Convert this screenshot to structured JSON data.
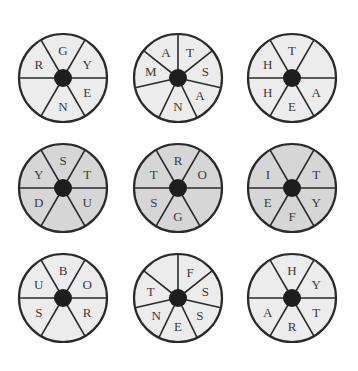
{
  "puzzle": {
    "colors": {
      "light_fill": "#ececec",
      "dark_fill": "#d6d6d6",
      "stroke": "#2a2a2a",
      "hub": "#1e1e1e",
      "text": "#3a3a3a"
    },
    "wheels": [
      {
        "id": 1,
        "cx": 63,
        "cy": 78,
        "fill": "light",
        "segments": 6,
        "letters": [
          "G",
          "Y",
          "E",
          "N",
          "",
          "R"
        ]
      },
      {
        "id": 2,
        "cx": 178,
        "cy": 78,
        "fill": "light",
        "segments": 7,
        "letters": [
          "T",
          "S",
          "A",
          "N",
          "",
          "M",
          "A"
        ]
      },
      {
        "id": 3,
        "cx": 292,
        "cy": 78,
        "fill": "light",
        "segments": 6,
        "letters": [
          "T",
          "",
          "A",
          "E",
          "H",
          "H"
        ]
      },
      {
        "id": 4,
        "cx": 63,
        "cy": 188,
        "fill": "dark",
        "segments": 6,
        "letters": [
          "S",
          "T",
          "U",
          "",
          "D",
          "Y"
        ]
      },
      {
        "id": 5,
        "cx": 178,
        "cy": 188,
        "fill": "dark",
        "segments": 6,
        "letters": [
          "R",
          "O",
          "",
          "G",
          "S",
          "T"
        ]
      },
      {
        "id": 6,
        "cx": 292,
        "cy": 188,
        "fill": "dark",
        "segments": 6,
        "letters": [
          "",
          "T",
          "Y",
          "F",
          "E",
          "I"
        ]
      },
      {
        "id": 7,
        "cx": 63,
        "cy": 298,
        "fill": "light",
        "segments": 6,
        "letters": [
          "B",
          "O",
          "R",
          "",
          "S",
          "U"
        ]
      },
      {
        "id": 8,
        "cx": 178,
        "cy": 298,
        "fill": "light",
        "segments": 7,
        "letters": [
          "F",
          "S",
          "S",
          "E",
          "N",
          "T",
          ""
        ]
      },
      {
        "id": 9,
        "cx": 292,
        "cy": 298,
        "fill": "light",
        "segments": 6,
        "letters": [
          "H",
          "Y",
          "T",
          "R",
          "A",
          ""
        ]
      }
    ]
  }
}
